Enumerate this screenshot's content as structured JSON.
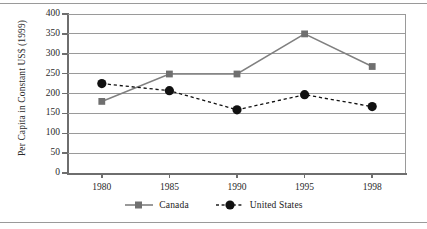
{
  "chart_data": {
    "type": "line",
    "title": "",
    "xlabel": "",
    "ylabel": "Per Capita in Constant US$ (1999)",
    "categories": [
      "1980",
      "1985",
      "1990",
      "1995",
      "1998"
    ],
    "x_tick_labels": [
      "1980",
      "1985",
      "1990",
      "1995",
      "1998"
    ],
    "y_tick_labels": [
      "0",
      "50",
      "100",
      "150",
      "200",
      "250",
      "300",
      "350",
      "400"
    ],
    "y_ticks": [
      0,
      50,
      100,
      150,
      200,
      250,
      300,
      350,
      400
    ],
    "ylim": [
      0,
      400
    ],
    "grid": "horizontal",
    "legend_position": "bottom-center",
    "series": [
      {
        "name": "Canada",
        "values": [
          180,
          249,
          249,
          350,
          268
        ],
        "color": "#808080",
        "line_style": "solid",
        "marker": "square"
      },
      {
        "name": "United States",
        "values": [
          225,
          207,
          159,
          197,
          167
        ],
        "color": "#111111",
        "line_style": "dashed",
        "marker": "circle"
      }
    ]
  },
  "legend": {
    "items": [
      {
        "label": "Canada",
        "marker": "square-marker-icon"
      },
      {
        "label": "United States",
        "marker": "circle-marker-icon"
      }
    ]
  }
}
